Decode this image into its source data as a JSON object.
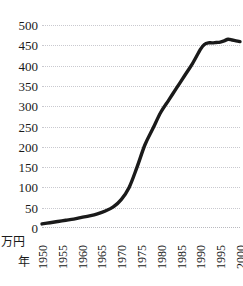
{
  "caption": {
    "top_partial": "",
    "bottom_partial": ""
  },
  "axis_units": {
    "y_unit": "万円",
    "x_unit": "年"
  },
  "chart_data": {
    "type": "line",
    "title": "",
    "xlabel": "年",
    "ylabel": "万円",
    "xlim": [
      1950,
      2000
    ],
    "ylim": [
      0,
      500
    ],
    "grid": true,
    "legend": "none",
    "line_color": "#1a1a1a",
    "y_ticks": [
      500,
      450,
      400,
      350,
      300,
      250,
      200,
      150,
      100,
      50,
      0
    ],
    "x_ticks": [
      1950,
      1955,
      1960,
      1965,
      1970,
      1975,
      1980,
      1985,
      1990,
      1995,
      2000
    ],
    "x": [
      1950,
      1952,
      1954,
      1956,
      1958,
      1960,
      1962,
      1964,
      1966,
      1968,
      1970,
      1972,
      1974,
      1976,
      1978,
      1980,
      1982,
      1984,
      1986,
      1988,
      1990,
      1991,
      1992,
      1993,
      1994,
      1995,
      1996,
      1997,
      1998,
      1999,
      2000
    ],
    "values": [
      10,
      13,
      16,
      19,
      22,
      26,
      30,
      35,
      42,
      52,
      70,
      100,
      150,
      205,
      245,
      285,
      315,
      345,
      375,
      405,
      440,
      452,
      456,
      456,
      457,
      458,
      461,
      465,
      463,
      461,
      459
    ]
  }
}
